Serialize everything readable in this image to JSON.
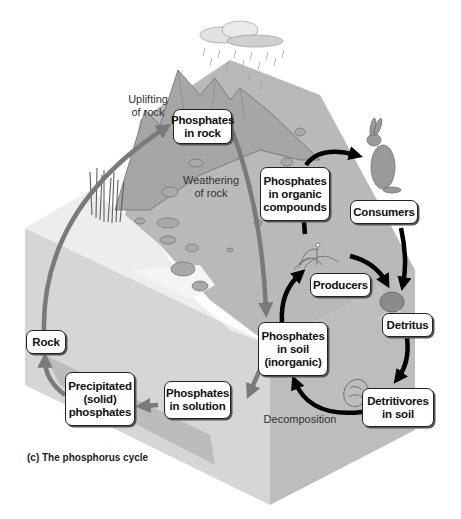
{
  "caption": "(c) The phosphorus cycle",
  "nodes": {
    "phosphates_in_rock": "Phosphates\nin rock",
    "phosphates_organic": "Phosphates\nin organic\ncompounds",
    "consumers": "Consumers",
    "producers": "Producers",
    "detritus": "Detritus",
    "phosphates_soil": "Phosphates\nin soil\n(inorganic)",
    "detritivores": "Detritivores\nin soil",
    "phosphates_solution": "Phosphates\nin solution",
    "precipitated": "Precipitated\n(solid)\nphosphates",
    "rock": "Rock"
  },
  "labels": {
    "uplifting": "Uplifting\nof rock",
    "weathering": "Weathering\nof rock",
    "decomposition": "Decomposition"
  },
  "colors": {
    "geologic_arrow": "#7a7a7a",
    "biologic_arrow": "#000000",
    "ground_top": "#b9b9b9",
    "block_left_face": "#d6d6d6",
    "block_right_face": "#bdbdbd",
    "water_top": "#ededed"
  }
}
